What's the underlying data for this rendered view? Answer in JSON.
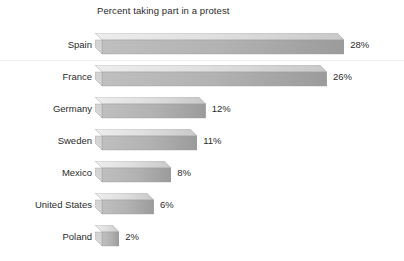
{
  "chart_data": {
    "type": "bar",
    "orientation": "horizontal",
    "title": "Percent taking part in a protest",
    "xlabel": "",
    "ylabel": "",
    "categories": [
      "Spain",
      "France",
      "Germany",
      "Sweden",
      "Mexico",
      "United States",
      "Poland"
    ],
    "values": [
      28,
      26,
      12,
      11,
      8,
      6,
      2
    ],
    "value_labels": [
      "28%",
      "26%",
      "12%",
      "11%",
      "8%",
      "6%",
      "2%"
    ],
    "unit": "%",
    "xlim": [
      0,
      28
    ],
    "grid": false,
    "legend": null,
    "legend_position": "none",
    "axis_ticks_visible": false,
    "style": {
      "background": "#ffffff",
      "bar_top_face": "#e3e3e3",
      "bar_front_face": "#a8a8a8",
      "bar_side_face": "#bdbdbd",
      "bar_outline": "#9a9a9a",
      "text_color": "#2b2b2b",
      "divider_color": "#f0f0f0"
    }
  },
  "layout": {
    "bar_origin_x": 95,
    "px_per_percent": 8.65,
    "bar_depth": 7,
    "row_height": 32,
    "first_row_top": 31
  }
}
